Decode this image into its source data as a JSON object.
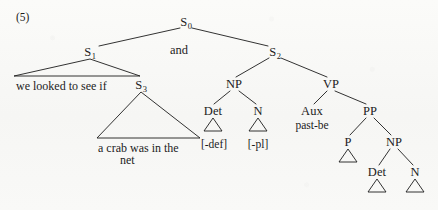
{
  "figure": {
    "example_number": "(5)",
    "caption_text": "",
    "width": 438,
    "height": 210,
    "background_color": "#f8f8f6",
    "ink_color": "#1c1c1c"
  },
  "tree": {
    "nodes": [
      {
        "id": "s0",
        "label": "S",
        "subscript": "0",
        "x": 186,
        "y": 22,
        "kind": "nonterminal"
      },
      {
        "id": "s1",
        "label": "S",
        "subscript": "1",
        "x": 90,
        "y": 52,
        "kind": "nonterminal"
      },
      {
        "id": "conj",
        "label": "and",
        "subscript": "",
        "x": 179,
        "y": 50,
        "kind": "conjunction"
      },
      {
        "id": "s2",
        "label": "S",
        "subscript": "2",
        "x": 275,
        "y": 52,
        "kind": "nonterminal"
      },
      {
        "id": "s3",
        "label": "S",
        "subscript": "3",
        "x": 141,
        "y": 85,
        "kind": "nonterminal"
      },
      {
        "id": "np1",
        "label": "NP",
        "subscript": "",
        "x": 234,
        "y": 84,
        "kind": "nonterminal"
      },
      {
        "id": "vp",
        "label": "VP",
        "subscript": "",
        "x": 331,
        "y": 84,
        "kind": "nonterminal"
      },
      {
        "id": "det1",
        "label": "Det",
        "subscript": "",
        "x": 213,
        "y": 111,
        "kind": "nonterminal"
      },
      {
        "id": "n1",
        "label": "N",
        "subscript": "",
        "x": 258,
        "y": 111,
        "kind": "nonterminal"
      },
      {
        "id": "aux",
        "label": "Aux",
        "subscript": "",
        "x": 312,
        "y": 111,
        "kind": "nonterminal"
      },
      {
        "id": "pp",
        "label": "PP",
        "subscript": "",
        "x": 370,
        "y": 111,
        "kind": "nonterminal"
      },
      {
        "id": "p",
        "label": "P",
        "subscript": "",
        "x": 348,
        "y": 142,
        "kind": "nonterminal"
      },
      {
        "id": "np2",
        "label": "NP",
        "subscript": "",
        "x": 394,
        "y": 142,
        "kind": "nonterminal"
      },
      {
        "id": "det2",
        "label": "Det",
        "subscript": "",
        "x": 377,
        "y": 172,
        "kind": "nonterminal"
      },
      {
        "id": "n2",
        "label": "N",
        "subscript": "",
        "x": 415,
        "y": 172,
        "kind": "nonterminal"
      }
    ],
    "edges": [
      {
        "from": "s0",
        "to": "s1",
        "x1": 180,
        "y1": 28,
        "x2": 99,
        "y2": 46
      },
      {
        "from": "s0",
        "to": "s2",
        "x1": 192,
        "y1": 28,
        "x2": 268,
        "y2": 46
      },
      {
        "from": "s2",
        "to": "np1",
        "x1": 269,
        "y1": 58,
        "x2": 236,
        "y2": 77
      },
      {
        "from": "s2",
        "to": "vp",
        "x1": 281,
        "y1": 58,
        "x2": 327,
        "y2": 77
      },
      {
        "from": "np1",
        "to": "det1",
        "x1": 230,
        "y1": 91,
        "x2": 214,
        "y2": 104
      },
      {
        "from": "np1",
        "to": "n1",
        "x1": 239,
        "y1": 91,
        "x2": 256,
        "y2": 104
      },
      {
        "from": "vp",
        "to": "aux",
        "x1": 327,
        "y1": 91,
        "x2": 314,
        "y2": 104
      },
      {
        "from": "vp",
        "to": "pp",
        "x1": 335,
        "y1": 91,
        "x2": 366,
        "y2": 104
      },
      {
        "from": "pp",
        "to": "p",
        "x1": 366,
        "y1": 118,
        "x2": 350,
        "y2": 135
      },
      {
        "from": "pp",
        "to": "np2",
        "x1": 374,
        "y1": 118,
        "x2": 391,
        "y2": 135
      },
      {
        "from": "np2",
        "to": "det2",
        "x1": 390,
        "y1": 149,
        "x2": 379,
        "y2": 165
      },
      {
        "from": "np2",
        "to": "n2",
        "x1": 398,
        "y1": 149,
        "x2": 413,
        "y2": 165
      }
    ],
    "big_triangles": [
      {
        "id": "s1-triangle",
        "apex_x": 90,
        "apex_y": 59,
        "left_x": 14,
        "right_x": 140,
        "base_y": 76,
        "text_lines": [
          "we looked to see if"
        ],
        "text_x": 16,
        "text_y": 80
      },
      {
        "id": "s3-triangle",
        "apex_x": 141,
        "apex_y": 92,
        "left_x": 97,
        "right_x": 200,
        "base_y": 138,
        "text_lines": [
          "a crab was in the",
          "net"
        ],
        "text_x": 98,
        "text_y": 142
      }
    ],
    "small_triangles": [
      {
        "id": "det1-triangle",
        "cx": 213,
        "top_y": 118,
        "base_y": 131,
        "half_width": 9
      },
      {
        "id": "n1-triangle",
        "cx": 258,
        "top_y": 118,
        "base_y": 131,
        "half_width": 9
      },
      {
        "id": "p-triangle",
        "cx": 348,
        "top_y": 149,
        "base_y": 162,
        "half_width": 9
      },
      {
        "id": "det2-triangle",
        "cx": 377,
        "top_y": 179,
        "base_y": 192,
        "half_width": 9
      },
      {
        "id": "n2-triangle",
        "cx": 415,
        "top_y": 179,
        "base_y": 192,
        "half_width": 9
      }
    ],
    "terminals": [
      {
        "id": "det1-terminal",
        "text": "[-def]",
        "x": 214,
        "y": 145
      },
      {
        "id": "n1-terminal",
        "text": "[-pl]",
        "x": 258,
        "y": 145
      },
      {
        "id": "aux-terminal",
        "text": "past-be",
        "x": 312,
        "y": 126
      }
    ]
  }
}
